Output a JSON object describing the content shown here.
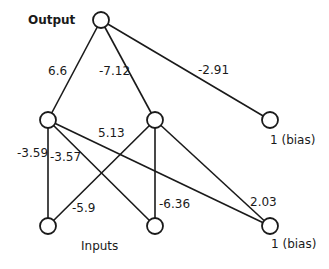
{
  "diagram": {
    "type": "neural-network",
    "labels": {
      "output": "Output",
      "inputs": "Inputs",
      "bias_top": "1 (bias)",
      "bias_bottom": "1 (bias)"
    },
    "nodes": [
      {
        "id": "output",
        "x": 101,
        "y": 20
      },
      {
        "id": "hidden1",
        "x": 48,
        "y": 120
      },
      {
        "id": "hidden2",
        "x": 155,
        "y": 120
      },
      {
        "id": "bias_top",
        "x": 270,
        "y": 120
      },
      {
        "id": "input1",
        "x": 48,
        "y": 226
      },
      {
        "id": "input2",
        "x": 155,
        "y": 226
      },
      {
        "id": "bias_bottom",
        "x": 270,
        "y": 226
      }
    ],
    "edges": [
      {
        "from": "output",
        "to": "hidden1",
        "weight": "6.6"
      },
      {
        "from": "output",
        "to": "hidden2",
        "weight": "-7.12"
      },
      {
        "from": "output",
        "to": "bias_top",
        "weight": "-2.91"
      },
      {
        "from": "hidden1",
        "to": "input1",
        "weight": "-3.59"
      },
      {
        "from": "hidden1",
        "to": "input2",
        "weight": "-3.57"
      },
      {
        "from": "hidden1",
        "to": "bias_bottom",
        "weight": "5.13"
      },
      {
        "from": "hidden2",
        "to": "input1",
        "weight": "-5.9"
      },
      {
        "from": "hidden2",
        "to": "input2",
        "weight": "-6.36"
      },
      {
        "from": "hidden2",
        "to": "bias_bottom",
        "weight": "2.03"
      }
    ]
  }
}
